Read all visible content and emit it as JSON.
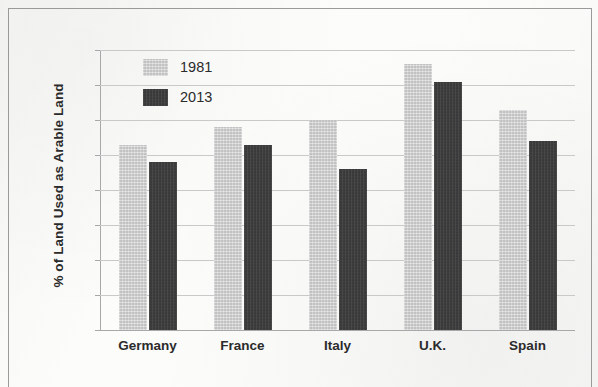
{
  "chart_data": {
    "type": "bar",
    "title": "",
    "subtitle": "",
    "xlabel": "",
    "ylabel": "% of Land Used as Arable Land",
    "categories": [
      "Germany",
      "France",
      "Italy",
      "U.K.",
      "Spain"
    ],
    "series": [
      {
        "name": "1981",
        "color": "#cfcfcf",
        "values": [
          53,
          58,
          60,
          76,
          63
        ]
      },
      {
        "name": "2013",
        "color": "#3c3c3c",
        "values": [
          48,
          53,
          46,
          71,
          54
        ]
      }
    ],
    "ylim": [
      0,
      80
    ],
    "ytick_step": 10,
    "yticks": [
      80,
      70,
      60,
      50,
      40,
      30,
      20,
      10,
      0
    ],
    "ytick_labels": [
      "80",
      "70",
      "60",
      "50",
      "40",
      "30",
      "20",
      "10",
      "0"
    ],
    "grid": "horizontal",
    "legend_position": "top-left-inside",
    "annotations": []
  },
  "legend": {
    "entries": [
      {
        "label": "1981",
        "color": "#cfcfcf"
      },
      {
        "label": "2013",
        "color": "#3c3c3c"
      }
    ]
  },
  "colors": {
    "series_1981": "#cfcfcf",
    "series_2013": "#3c3c3c",
    "gridline": "#c9c9c9",
    "axis": "#a8a8a8",
    "text": "#2b2b2b",
    "border": "#9a9a9a",
    "background": "#fcfcfb"
  }
}
